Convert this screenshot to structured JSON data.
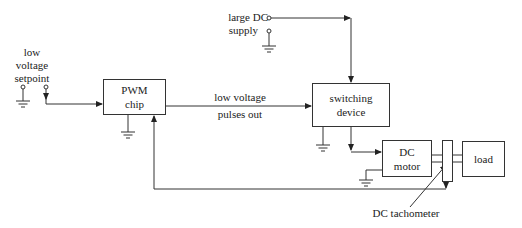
{
  "diagram": {
    "type": "block-diagram",
    "blocks": {
      "pwm": {
        "line1": "PWM",
        "line2": "chip"
      },
      "switching": {
        "line1": "switching",
        "line2": "device"
      },
      "motor": {
        "line1": "DC",
        "line2": "motor"
      },
      "tach": {
        "label": ""
      },
      "load": {
        "line1": "load"
      }
    },
    "labels": {
      "setpoint": {
        "line1": "low",
        "line2": "voltage",
        "line3": "setpoint"
      },
      "supply": {
        "line1": "large DC",
        "line2": "supply"
      },
      "pulses": {
        "line1": "low voltage",
        "line2": "pulses out"
      },
      "tachometer": "DC tachometer"
    },
    "colors": {
      "line": "#333333",
      "background": "#ffffff",
      "text": "#222222"
    }
  }
}
